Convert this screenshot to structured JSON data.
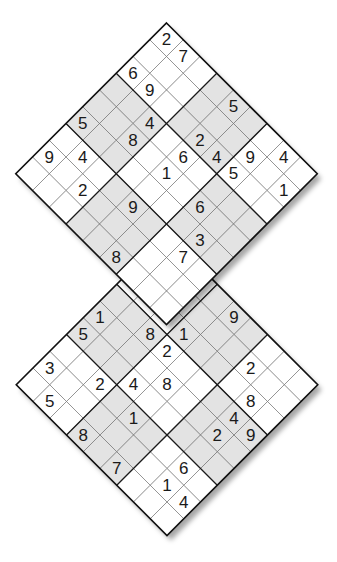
{
  "puzzle": {
    "type": "twin-diamond sudoku",
    "grid_size": 9,
    "box_size": 3,
    "shaded_color": "#e3e3e3",
    "grids": [
      {
        "name": "top",
        "givens": [
          {
            "r": 0,
            "c": 0,
            "v": "2"
          },
          {
            "r": 0,
            "c": 1,
            "v": "7"
          },
          {
            "r": 2,
            "c": 0,
            "v": "6"
          },
          {
            "r": 2,
            "c": 1,
            "v": "9"
          },
          {
            "r": 0,
            "c": 4,
            "v": "5"
          },
          {
            "r": 5,
            "c": 0,
            "v": "5"
          },
          {
            "r": 3,
            "c": 2,
            "v": "4"
          },
          {
            "r": 4,
            "c": 2,
            "v": "8"
          },
          {
            "r": 2,
            "c": 4,
            "v": "2"
          },
          {
            "r": 7,
            "c": 0,
            "v": "9"
          },
          {
            "r": 6,
            "c": 1,
            "v": "4"
          },
          {
            "r": 3,
            "c": 4,
            "v": "6"
          },
          {
            "r": 2,
            "c": 5,
            "v": "4"
          },
          {
            "r": 1,
            "c": 6,
            "v": "9"
          },
          {
            "r": 0,
            "c": 7,
            "v": "4"
          },
          {
            "r": 4,
            "c": 4,
            "v": "1"
          },
          {
            "r": 2,
            "c": 6,
            "v": "5"
          },
          {
            "r": 7,
            "c": 2,
            "v": "2"
          },
          {
            "r": 1,
            "c": 8,
            "v": "1"
          },
          {
            "r": 6,
            "c": 4,
            "v": "9"
          },
          {
            "r": 4,
            "c": 6,
            "v": "6"
          },
          {
            "r": 5,
            "c": 7,
            "v": "3"
          },
          {
            "r": 8,
            "c": 5,
            "v": "8"
          },
          {
            "r": 6,
            "c": 7,
            "v": "7"
          }
        ]
      },
      {
        "name": "bottom",
        "givens": [
          {
            "r": 4,
            "c": 0,
            "v": "1"
          },
          {
            "r": 0,
            "c": 4,
            "v": "9"
          },
          {
            "r": 5,
            "c": 0,
            "v": "5"
          },
          {
            "r": 3,
            "c": 2,
            "v": "8"
          },
          {
            "r": 2,
            "c": 3,
            "v": "1"
          },
          {
            "r": 3,
            "c": 3,
            "v": "2"
          },
          {
            "r": 7,
            "c": 0,
            "v": "3"
          },
          {
            "r": 1,
            "c": 6,
            "v": "2"
          },
          {
            "r": 6,
            "c": 2,
            "v": "2"
          },
          {
            "r": 5,
            "c": 3,
            "v": "4"
          },
          {
            "r": 4,
            "c": 4,
            "v": "8"
          },
          {
            "r": 8,
            "c": 1,
            "v": "5"
          },
          {
            "r": 2,
            "c": 7,
            "v": "8"
          },
          {
            "r": 6,
            "c": 4,
            "v": "1"
          },
          {
            "r": 3,
            "c": 7,
            "v": "4"
          },
          {
            "r": 8,
            "c": 3,
            "v": "8"
          },
          {
            "r": 4,
            "c": 7,
            "v": "2"
          },
          {
            "r": 3,
            "c": 8,
            "v": "9"
          },
          {
            "r": 8,
            "c": 5,
            "v": "7"
          },
          {
            "r": 6,
            "c": 7,
            "v": "6"
          },
          {
            "r": 7,
            "c": 7,
            "v": "1"
          },
          {
            "r": 7,
            "c": 8,
            "v": "4"
          }
        ]
      }
    ]
  }
}
